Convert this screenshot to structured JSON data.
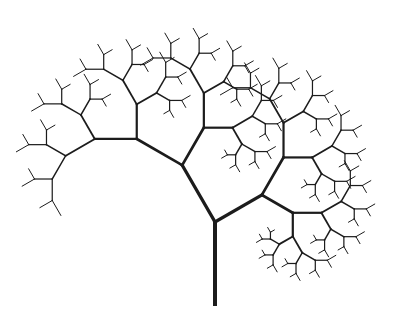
{
  "figure": {
    "title": "Fractal tree",
    "background": "#ffffff",
    "stroke_color": "#1c1c1c"
  },
  "tree": {
    "trunk_base": {
      "x": 215,
      "y": 304
    },
    "trunk_length": 82,
    "trunk_heading_deg": 0,
    "left_branch": {
      "turn_deg": -30,
      "length_ratio": 0.8
    },
    "right_branch": {
      "turn_deg": 60,
      "length_ratio": 0.66
    },
    "depth": 7,
    "stroke_width_trunk": 4,
    "stroke_width_decay": 0.82,
    "stroke_width_min": 1
  },
  "key_nodes": [
    {
      "name": "trunk-base",
      "x": 215,
      "y": 304
    },
    {
      "name": "first-fork",
      "x": 215,
      "y": 222
    },
    {
      "name": "left-fork",
      "x": 183,
      "y": 165
    },
    {
      "name": "right-fork",
      "x": 262,
      "y": 195
    }
  ]
}
